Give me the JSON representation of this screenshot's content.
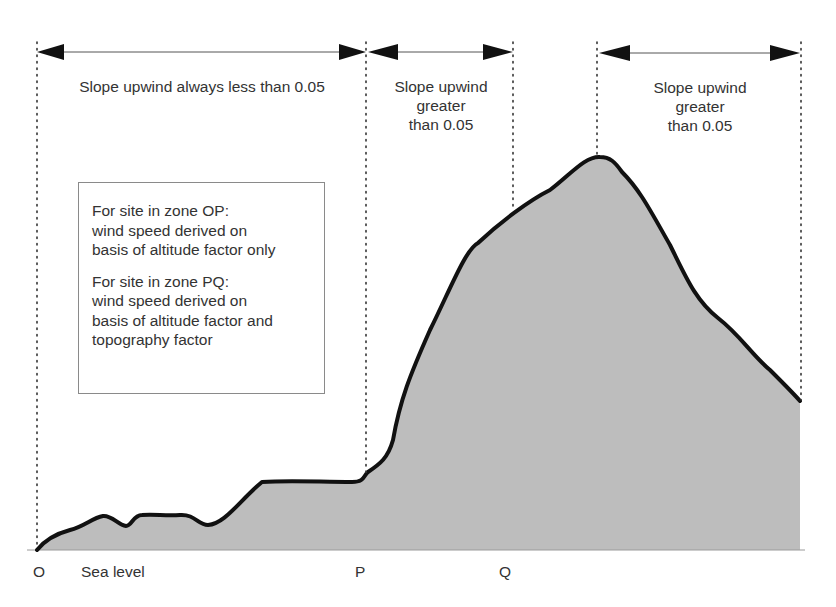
{
  "zones": [
    {
      "label": "Slope upwind always less than 0.05",
      "lines": [
        "Slope upwind always less than 0.05"
      ]
    },
    {
      "label": "Slope upwind greater than 0.05",
      "lines": [
        "Slope upwind",
        "greater",
        "than 0.05"
      ]
    },
    {
      "label": "Slope upwind greater than 0.05",
      "lines": [
        "Slope upwind",
        "greater",
        "than 0.05"
      ]
    }
  ],
  "note_box": {
    "op": [
      "For site in zone OP:",
      "wind speed derived on",
      "basis of altitude factor only"
    ],
    "pq": [
      "For site in zone PQ:",
      "wind speed derived on",
      "basis of altitude factor and",
      "topography factor"
    ]
  },
  "axis_labels": {
    "o": "O",
    "sea_level": "Sea level",
    "p": "P",
    "q": "Q"
  },
  "colors": {
    "terrain_fill": "#bdbdbd",
    "terrain_outline": "#111111",
    "text": "#333333"
  }
}
